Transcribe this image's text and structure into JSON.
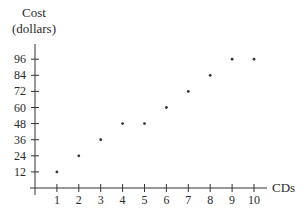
{
  "chart_data": {
    "type": "scatter",
    "title": "",
    "ylabel": "Cost (dollars)",
    "ylabel_lines": [
      "Cost",
      "(dollars)"
    ],
    "xlabel": "CDs",
    "x": [
      1,
      2,
      3,
      4,
      5,
      6,
      7,
      8,
      9,
      10
    ],
    "y": [
      12,
      24,
      36,
      48,
      48,
      60,
      72,
      84,
      96,
      96
    ],
    "xticks": [
      1,
      2,
      3,
      4,
      5,
      6,
      7,
      8,
      9,
      10
    ],
    "yticks": [
      12,
      24,
      36,
      48,
      60,
      72,
      84,
      96
    ],
    "xlim": [
      0,
      10.6
    ],
    "ylim": [
      0,
      106
    ],
    "grid": false,
    "legend": null,
    "marker_color": "#333333",
    "axis_color": "#333333"
  }
}
